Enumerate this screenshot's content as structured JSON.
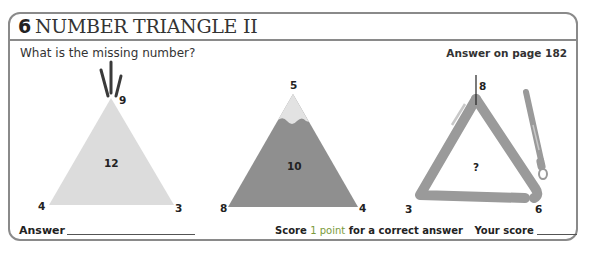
{
  "header": {
    "number": "6",
    "title": "NUMBER TRIANGLE II"
  },
  "question": "What is the missing number?",
  "answer_reference": "Answer on page 182",
  "puzzles": [
    {
      "name": "tipi",
      "top": "9",
      "left": "4",
      "right": "3",
      "center": "12",
      "fill": "#dcdcdc"
    },
    {
      "name": "mountain",
      "top": "5",
      "left": "8",
      "right": "4",
      "center": "10",
      "fill": "#8f8f8f",
      "snow": "#e2e2e2"
    },
    {
      "name": "triangle-instrument",
      "top": "8",
      "left": "3",
      "right": "6",
      "center": "?",
      "fill": "#9a9a9a"
    }
  ],
  "footer": {
    "answer_label": "Answer",
    "score_prefix": "Score",
    "score_points": "1 point",
    "score_suffix": "for a correct answer",
    "your_score_label": "Your score"
  },
  "colors": {
    "border": "#8a8a8a",
    "accent_green": "#7a9a3a"
  }
}
